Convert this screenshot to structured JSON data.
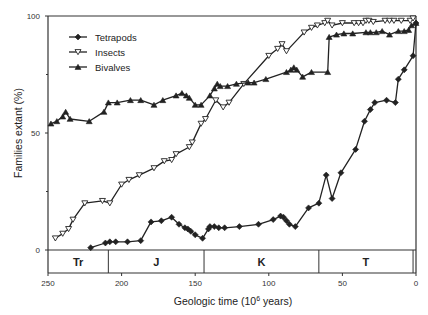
{
  "chart_data": {
    "type": "line",
    "title": "",
    "xlabel": "Geologic time (10^6 years)",
    "xlabel_base": "Geologic time (10",
    "xlabel_sup": "6",
    "xlabel_tail": " years)",
    "ylabel": "Families extant (%)",
    "xlim": [
      250,
      0
    ],
    "ylim": [
      0,
      100
    ],
    "x_reversed": true,
    "x_ticks": [
      250,
      200,
      150,
      100,
      50,
      0
    ],
    "y_ticks": [
      0,
      50,
      100
    ],
    "y_minor_ticks": [
      25,
      75
    ],
    "grid": false,
    "legend_position": "upper left",
    "legend": [
      {
        "name": "Tetrapods",
        "marker": "diamond-filled"
      },
      {
        "name": "Insects",
        "marker": "triangle-down-open"
      },
      {
        "name": "Bivalves",
        "marker": "triangle-up-filled"
      }
    ],
    "periods": [
      {
        "label": "Tr",
        "start": 250,
        "end": 209
      },
      {
        "label": "J",
        "start": 209,
        "end": 144
      },
      {
        "label": "K",
        "start": 144,
        "end": 66
      },
      {
        "label": "T",
        "start": 66,
        "end": 2
      },
      {
        "label": "",
        "start": 2,
        "end": 0
      }
    ],
    "series": [
      {
        "name": "Tetrapods",
        "marker": "diamond-filled",
        "x": [
          221,
          211,
          208,
          204,
          196,
          187,
          180,
          173,
          166,
          161,
          157,
          155,
          153,
          150,
          145,
          141,
          140,
          137,
          134,
          130,
          120,
          107,
          97,
          92,
          90,
          88,
          86,
          82,
          73,
          66,
          61,
          57,
          51,
          41,
          35,
          31,
          28,
          20,
          14,
          12,
          8,
          2,
          0
        ],
        "y": [
          1,
          3,
          3.5,
          3.5,
          3.5,
          4,
          12,
          12.5,
          14,
          11,
          9.5,
          9,
          8,
          6.5,
          5,
          9,
          10,
          10,
          9.5,
          9.5,
          10,
          11,
          13,
          14.5,
          14,
          12.5,
          11,
          10,
          18,
          20,
          32,
          22,
          33,
          43,
          55,
          60,
          63,
          64,
          63,
          73,
          77,
          83,
          97
        ]
      },
      {
        "name": "Insects",
        "marker": "triangle-down-open",
        "x": [
          245,
          240,
          236,
          233,
          225,
          213,
          208,
          200,
          195,
          188,
          178,
          171,
          166,
          163,
          154,
          152,
          146,
          143,
          136,
          131,
          127,
          117,
          100,
          94,
          91,
          88,
          76,
          71,
          67,
          62,
          60,
          57,
          50,
          42,
          39,
          36,
          34,
          32,
          29,
          21,
          18,
          15,
          10,
          4,
          2
        ],
        "y": [
          5,
          7,
          9,
          13,
          20,
          21,
          20,
          28,
          30,
          32,
          35,
          38,
          38.5,
          41,
          44,
          46,
          54,
          56,
          64,
          61,
          63,
          71,
          83,
          86,
          88,
          85,
          93,
          95,
          96,
          97,
          98,
          96,
          97,
          97,
          97,
          97,
          98,
          98,
          97.5,
          98,
          98,
          98,
          98,
          98,
          99
        ]
      },
      {
        "name": "Bivalves",
        "marker": "triangle-up-filled",
        "x": [
          248,
          244,
          240,
          238,
          235,
          222,
          212,
          209,
          203,
          194,
          187,
          178,
          172,
          163,
          159,
          156,
          154,
          150,
          146,
          140,
          137,
          135,
          133,
          128,
          122,
          114,
          110,
          102,
          88,
          85,
          83,
          81,
          77,
          71,
          60,
          59,
          54,
          49,
          43,
          34,
          31,
          27,
          23,
          18,
          12,
          8,
          5,
          3,
          0
        ],
        "y": [
          54,
          55,
          57,
          59,
          56,
          55,
          59,
          63,
          63,
          64,
          64,
          62,
          64,
          66,
          67,
          66,
          65,
          62,
          62,
          66,
          69,
          71,
          70,
          70,
          71,
          71.5,
          71.5,
          73,
          76,
          77,
          78,
          77,
          74,
          76,
          76,
          91,
          92,
          92.5,
          92.5,
          93,
          93,
          93,
          93.5,
          92,
          93.5,
          93.5,
          94,
          96,
          97
        ]
      }
    ]
  }
}
